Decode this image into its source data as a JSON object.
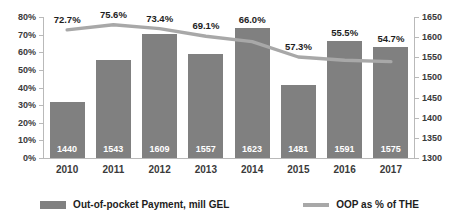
{
  "chart_data": {
    "type": "bar",
    "title": "",
    "subtitle": "",
    "xlabel": "",
    "ylabel": "",
    "grid": false,
    "legend_position": "bottom",
    "categories": [
      "2010",
      "2011",
      "2012",
      "2013",
      "2014",
      "2015",
      "2016",
      "2017"
    ],
    "axes": {
      "left": {
        "label": "",
        "ylim": [
          0,
          80
        ],
        "tick_labels": [
          "0%",
          "10%",
          "20%",
          "30%",
          "40%",
          "50%",
          "60%",
          "70%",
          "80%"
        ],
        "tick_values": [
          0,
          10,
          20,
          30,
          40,
          50,
          60,
          70,
          80
        ],
        "series_on_axis": "OOP as % of THE"
      },
      "right": {
        "label": "",
        "ylim": [
          1300,
          1650
        ],
        "tick_labels": [
          "1300",
          "1350",
          "1400",
          "1450",
          "1500",
          "1550",
          "1600",
          "1650"
        ],
        "tick_values": [
          1300,
          1350,
          1400,
          1450,
          1500,
          1550,
          1600,
          1650
        ],
        "series_on_axis": "Out-of-pocket Payment, mill GEL"
      }
    },
    "series": [
      {
        "name": "Out-of-pocket Payment, mill GEL",
        "type": "bar",
        "axis": "right",
        "color": "#808080",
        "values": [
          1440,
          1543,
          1609,
          1557,
          1623,
          1481,
          1591,
          1575
        ],
        "data_labels": [
          "1440",
          "1543",
          "1609",
          "1557",
          "1623",
          "1481",
          "1591",
          "1575"
        ]
      },
      {
        "name": "OOP as % of THE",
        "type": "line",
        "axis": "left",
        "color": "#a8a8a8",
        "values": [
          72.7,
          75.6,
          73.4,
          69.1,
          66.0,
          57.3,
          55.5,
          54.7
        ],
        "data_labels": [
          "72.7%",
          "75.6%",
          "73.4%",
          "69.1%",
          "66.0%",
          "57.3%",
          "55.5%",
          "54.7%"
        ]
      }
    ]
  },
  "legend": {
    "entries": [
      {
        "label": "Out-of-pocket Payment, mill GEL",
        "marker": "bar-swatch"
      },
      {
        "label": "OOP as % of THE",
        "marker": "line-swatch"
      }
    ]
  },
  "colors": {
    "bar": "#808080",
    "line": "#a8a8a8",
    "axis": "#b9b9b9",
    "tick_text": "#3a3a3a",
    "label_text": "#1d1d1d",
    "bar_value_text": "#ffffff",
    "background": "#ffffff"
  }
}
